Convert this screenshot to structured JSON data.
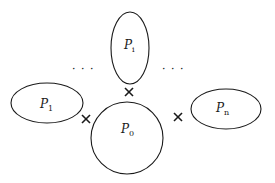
{
  "diagram": {
    "nodes": [
      {
        "id": "Pi",
        "label": "P",
        "subscript": "i",
        "shape": "ellipse-vertical"
      },
      {
        "id": "P1",
        "label": "P",
        "subscript": "1",
        "shape": "ellipse-horizontal"
      },
      {
        "id": "P0",
        "label": "P",
        "subscript": "0",
        "shape": "circle"
      },
      {
        "id": "Pn",
        "label": "P",
        "subscript": "n",
        "shape": "ellipse-horizontal"
      }
    ],
    "junctions": [
      {
        "between": [
          "Pi",
          "P0"
        ],
        "symbol": "×"
      },
      {
        "between": [
          "P1",
          "P0"
        ],
        "symbol": "×"
      },
      {
        "between": [
          "Pn",
          "P0"
        ],
        "symbol": "×"
      }
    ],
    "ellipsis_left": "· · ·",
    "ellipsis_right": "· · ·"
  }
}
